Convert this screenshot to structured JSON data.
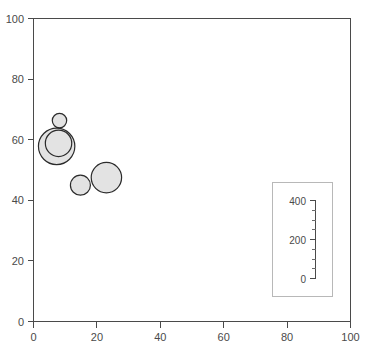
{
  "chart_data": {
    "type": "scatter",
    "title": "",
    "xlabel": "",
    "ylabel": "",
    "xlim": [
      0,
      100
    ],
    "ylim": [
      0,
      100
    ],
    "xticks": [
      0,
      20,
      40,
      60,
      80,
      100
    ],
    "yticks": [
      0,
      20,
      40,
      60,
      80,
      100
    ],
    "grid": false,
    "legend_position": "bottom-right",
    "bubble_fill": "#e3e3e3",
    "bubble_stroke": "#2b2b2b",
    "size_legend": {
      "title": "",
      "labels": [
        "400",
        "200",
        "0"
      ],
      "values": [
        400,
        200,
        0
      ],
      "minor_ticks": 8
    },
    "points": [
      {
        "label": "",
        "x": 8.2,
        "y": 66.3,
        "size": 55,
        "r_px": 7.2
      },
      {
        "label": "",
        "x": 7.3,
        "y": 57.8,
        "size": 400,
        "r_px": 18.2
      },
      {
        "label": "",
        "x": 7.9,
        "y": 58.8,
        "size": 210,
        "r_px": 13.2
      },
      {
        "label": "",
        "x": 14.8,
        "y": 45.0,
        "size": 120,
        "r_px": 10.0
      },
      {
        "label": "",
        "x": 23.0,
        "y": 47.5,
        "size": 260,
        "r_px": 15.2
      }
    ]
  },
  "axes": {
    "x": {
      "labels": [
        "0",
        "20",
        "40",
        "60",
        "80",
        "100"
      ]
    },
    "y": {
      "labels": [
        "0",
        "20",
        "40",
        "60",
        "80",
        "100"
      ]
    }
  },
  "legend": {
    "labels": [
      "400",
      "200",
      "0"
    ]
  }
}
